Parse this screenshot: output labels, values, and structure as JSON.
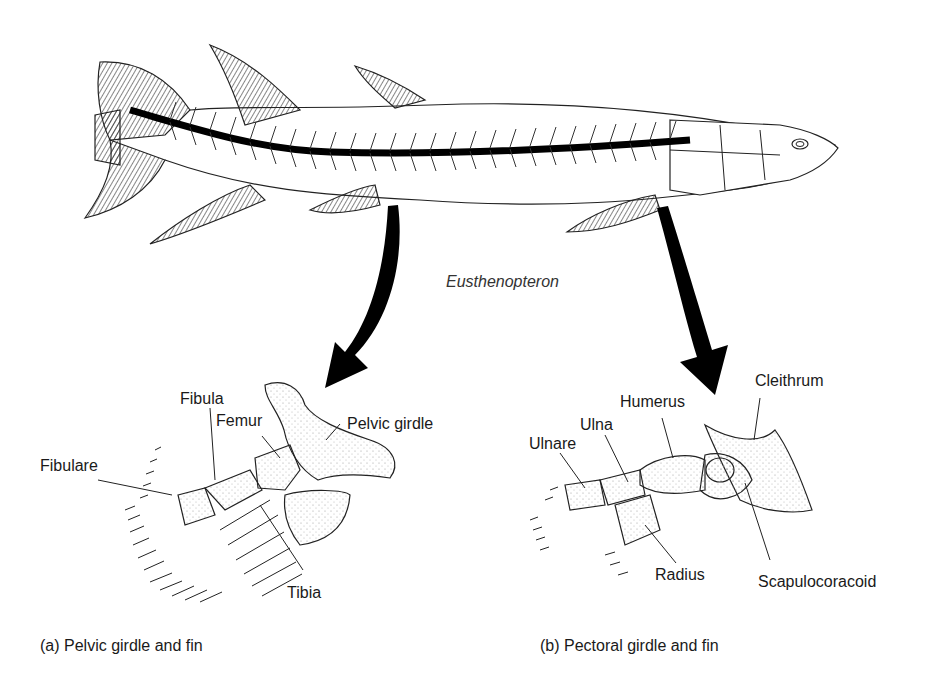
{
  "figure": {
    "species_label": "Eusthenopteron",
    "panels": [
      {
        "id": "a",
        "caption": "(a) Pelvic girdle and fin",
        "labels": {
          "fibula": "Fibula",
          "femur": "Femur",
          "pelvic_girdle": "Pelvic girdle",
          "fibulare": "Fibulare",
          "tibia": "Tibia"
        }
      },
      {
        "id": "b",
        "caption": "(b) Pectoral girdle and fin",
        "labels": {
          "cleithrum": "Cleithrum",
          "humerus": "Humerus",
          "ulna": "Ulna",
          "ulnare": "Ulnare",
          "radius": "Radius",
          "scapulocoracoid": "Scapulocoracoid"
        }
      }
    ]
  }
}
